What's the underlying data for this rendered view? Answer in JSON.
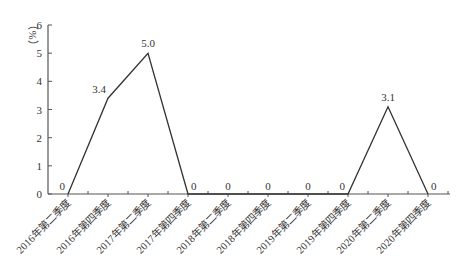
{
  "chart_data": {
    "type": "line",
    "title": "",
    "xlabel": "",
    "ylabel": "（%）",
    "ylim": [
      0,
      6
    ],
    "yticks": [
      0,
      1,
      2,
      3,
      4,
      5,
      6
    ],
    "grid": false,
    "legend": null,
    "categories": [
      "2016年第二季度",
      "2016年第四季度",
      "2017年第二季度",
      "2017年第四季度",
      "2018年第二季度",
      "2018年第四季度",
      "2019年第二季度",
      "2019年第四季度",
      "2020年第二季度",
      "2020年第四季度"
    ],
    "series": [
      {
        "name": "",
        "values": [
          0,
          3.4,
          5.0,
          0,
          0,
          0,
          0,
          0,
          3.1,
          0
        ],
        "data_labels": [
          "0",
          "3.4",
          "5.0",
          "0",
          "0",
          "0",
          "0",
          "0",
          "3.1",
          "0"
        ]
      }
    ],
    "colors": {
      "line": "#333333",
      "axis": "#555555"
    }
  }
}
